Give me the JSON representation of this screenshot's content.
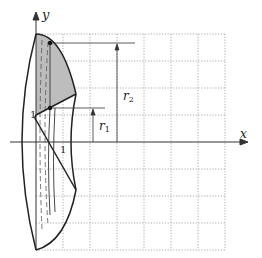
{
  "figure": {
    "type": "solid-of-revolution diagram",
    "axes": {
      "x_label": "x",
      "y_label": "y"
    },
    "tick_labels": {
      "x_one": "1",
      "y_one": "1"
    },
    "annotations": {
      "r1": {
        "symbol": "r",
        "subscript": "1"
      },
      "r2": {
        "symbol": "r",
        "subscript": "2"
      }
    },
    "colors": {
      "shaded_region": "#bdbdbd",
      "outline": "#222222",
      "grid": "#9a9a9a",
      "axis": "#333333"
    }
  }
}
